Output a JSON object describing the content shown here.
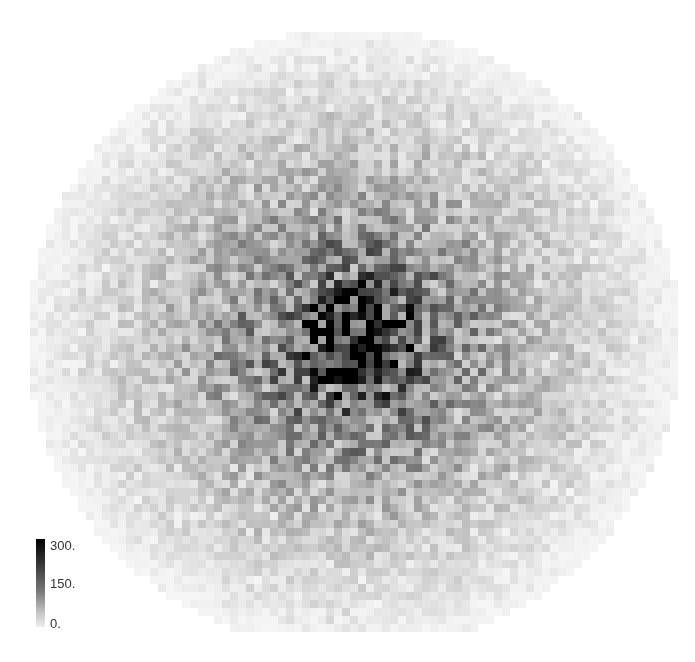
{
  "chart_data": {
    "type": "heatmap",
    "title": "",
    "xlabel": "",
    "ylabel": "",
    "grid_cells": {
      "cols": 82,
      "rows": 76
    },
    "center_cell": {
      "col": 40,
      "row": 39
    },
    "value_range": [
      0,
      300
    ],
    "peak_value_approx": 300,
    "radial_profile": [
      {
        "r_frac": 0.0,
        "value": 300
      },
      {
        "r_frac": 0.1,
        "value": 250
      },
      {
        "r_frac": 0.25,
        "value": 140
      },
      {
        "r_frac": 0.5,
        "value": 80
      },
      {
        "r_frac": 0.75,
        "value": 40
      },
      {
        "r_frac": 1.0,
        "value": 5
      }
    ],
    "colormap": "grayscale (white=0, black=300)",
    "legend": {
      "position": "bottom-left",
      "ticks": [
        "300.",
        "150.",
        "0."
      ]
    },
    "grid": false
  },
  "legend": {
    "tick_max": "300.",
    "tick_mid": "150.",
    "tick_min": "0."
  }
}
